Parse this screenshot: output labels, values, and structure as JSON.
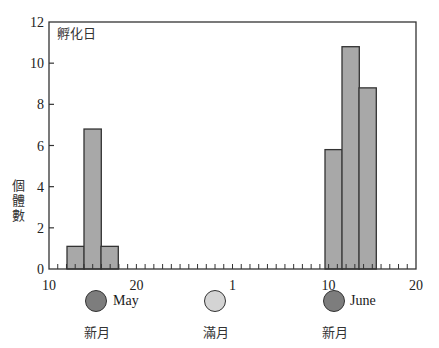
{
  "chart_data": {
    "type": "bar",
    "title": "孵化日",
    "xlabel": "",
    "ylabel": "個體數",
    "ylim": [
      0,
      12
    ],
    "yticks": [
      0,
      2,
      4,
      6,
      8,
      10,
      12
    ],
    "xtick_labels": [
      "10",
      "20",
      "1",
      "10",
      "20"
    ],
    "grid": false,
    "bins": [
      {
        "start_day": "May 13",
        "value": 1.1
      },
      {
        "start_day": "May 15",
        "value": 6.8
      },
      {
        "start_day": "May 17",
        "value": 1.1
      },
      {
        "start_day": "June 10",
        "value": 5.8
      },
      {
        "start_day": "June 12",
        "value": 10.8
      },
      {
        "start_day": "June 14",
        "value": 8.8
      }
    ],
    "annotations": [
      {
        "label": "新月",
        "month": "May",
        "phase": "new moon"
      },
      {
        "label": "滿月",
        "month": "",
        "phase": "full moon"
      },
      {
        "label": "新月",
        "month": "June",
        "phase": "new moon"
      }
    ]
  },
  "labels": {
    "title": "孵化日",
    "ylabel": "個\n體\n數",
    "may": "May",
    "june": "June",
    "new_moon": "新月",
    "full_moon": "滿月"
  },
  "colors": {
    "bar_fill": "#a8a8a8",
    "bar_stroke": "#333333",
    "new_moon": "#7d7d7d",
    "full_moon": "#d4d4d4"
  }
}
